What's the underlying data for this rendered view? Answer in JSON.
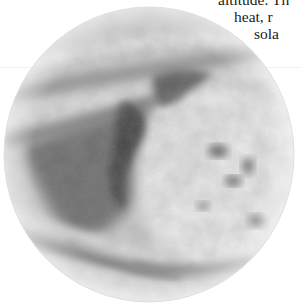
{
  "page": {
    "type": "scanned book page fragment",
    "background_color": "#ffffff"
  },
  "text_fragment": {
    "lines": [
      "altitude. Th",
      "heat, r",
      "sola"
    ],
    "color": "#1a1a1a"
  },
  "figure": {
    "style": "grayscale halftone",
    "shape": "circle",
    "colors": {
      "light": "#ececec",
      "mid": "#a8a8a8",
      "dark": "#4a4a4a",
      "edge": "#d8d8d8"
    }
  }
}
